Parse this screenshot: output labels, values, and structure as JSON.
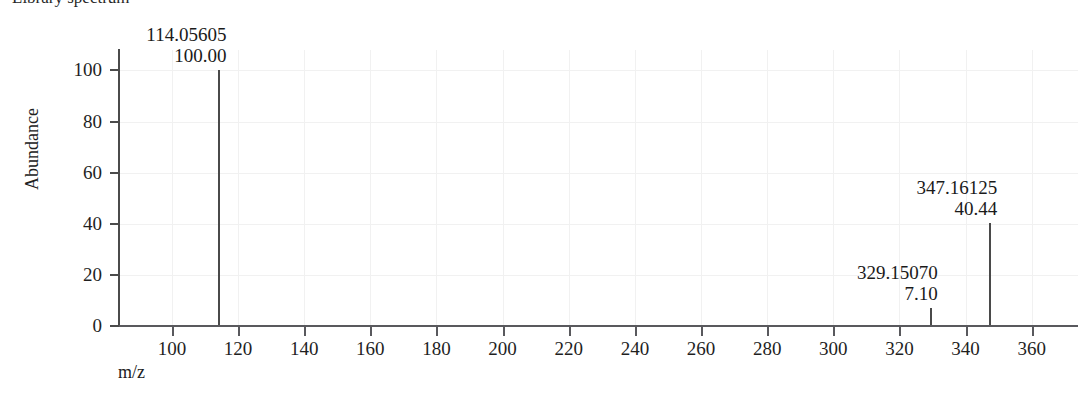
{
  "chart_data": {
    "type": "bar",
    "title": "Library spectrum",
    "xlabel": "m/z",
    "ylabel": "Abundance",
    "xlim": [
      84,
      374
    ],
    "ylim": [
      0,
      108
    ],
    "grid": true,
    "legend": null,
    "x_ticks": [
      100,
      120,
      140,
      160,
      180,
      200,
      220,
      240,
      260,
      280,
      300,
      320,
      340,
      360
    ],
    "x_tick_labels": [
      "100",
      "120",
      "140",
      "160",
      "180",
      "200",
      "220",
      "240",
      "260",
      "280",
      "300",
      "320",
      "340",
      "360"
    ],
    "y_ticks": [
      0,
      20,
      40,
      60,
      80,
      100
    ],
    "y_tick_labels": [
      "0",
      "20",
      "40",
      "60",
      "80",
      "100"
    ],
    "x": [
      114.05605,
      329.1507,
      347.16125
    ],
    "values": [
      100.0,
      7.1,
      40.44
    ],
    "peaks": [
      {
        "mz": "114.05605",
        "intensity": "100.00",
        "mz_value": 114.05605,
        "intensity_value": 100.0
      },
      {
        "mz": "329.15070",
        "intensity": "7.10",
        "mz_value": 329.1507,
        "intensity_value": 7.1
      },
      {
        "mz": "347.16125",
        "intensity": "40.44",
        "mz_value": 347.16125,
        "intensity_value": 40.44
      }
    ],
    "colors": {
      "peak": "#4a4a4a",
      "axis": "#59595d",
      "grid": "#f1f1f1",
      "text": "#1a1a1a",
      "background": "#ffffff"
    }
  }
}
